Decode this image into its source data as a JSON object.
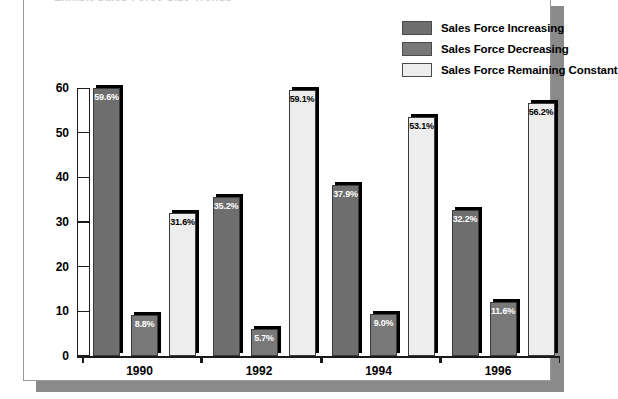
{
  "chart_data": {
    "type": "bar",
    "title": "",
    "xlabel": "",
    "ylabel": "",
    "ylim": [
      0,
      60
    ],
    "yticks": [
      0,
      10,
      20,
      30,
      40,
      50,
      60
    ],
    "grid": false,
    "legend_position": "top-right",
    "categories": [
      "1990",
      "1992",
      "1994",
      "1996"
    ],
    "series": [
      {
        "name": "Sales Force Increasing",
        "color": "#6e6e6e",
        "values": [
          59.6,
          35.2,
          37.9,
          32.2
        ],
        "labels": [
          "59.6%",
          "35.2%",
          "37.9%",
          "32.2%"
        ]
      },
      {
        "name": "Sales Force Decreasing",
        "color": "#787878",
        "values": [
          8.8,
          5.7,
          9.0,
          11.6
        ],
        "labels": [
          "8.8%",
          "5.7%",
          "9.0%",
          "11.6%"
        ]
      },
      {
        "name": "Sales Force Remaining Constant",
        "color": "#ededed",
        "values": [
          31.6,
          59.1,
          53.1,
          56.2
        ],
        "labels": [
          "31.6%",
          "59.1%",
          "53.1%",
          "56.2%"
        ]
      }
    ]
  },
  "legend": {
    "items": [
      {
        "label": "Sales Force Increasing",
        "color": "#6e6e6e"
      },
      {
        "label": "Sales Force Decreasing",
        "color": "#787878"
      },
      {
        "label": "Sales Force Remaining Constant",
        "color": "#ededed"
      }
    ]
  },
  "axis": {
    "y_tick_labels": [
      "60",
      "50",
      "40",
      "30",
      "20",
      "10",
      "0"
    ],
    "x_tick_labels": [
      "1990",
      "1992",
      "1994",
      "1996"
    ]
  },
  "title_fragment": "Exhibit  Sales Force Size Trends"
}
